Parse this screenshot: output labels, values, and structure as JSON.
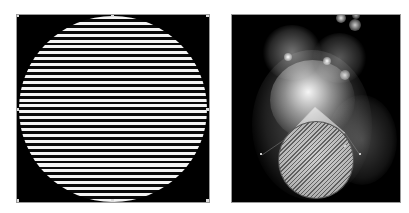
{
  "panels": {
    "left": {
      "description": "Black square canvas with a horizontally striped white-and-black circle",
      "stripe_period_px": 5.9,
      "stripe_count_approx": 32,
      "colors": {
        "background": "#000000",
        "stripe_light": "#f4f4f4",
        "stripe_dark": "#0a0a0a",
        "border": "#9a9a9a"
      }
    },
    "right": {
      "description": "Black canvas with overlapping glowing translucent blobs and a diagonally hatched circle selection with a triangle pointer",
      "colors": {
        "background": "#000000",
        "glow": "#ffffff",
        "hatch_fill": "#bdbdbd",
        "border": "#9a9a9a"
      }
    }
  }
}
